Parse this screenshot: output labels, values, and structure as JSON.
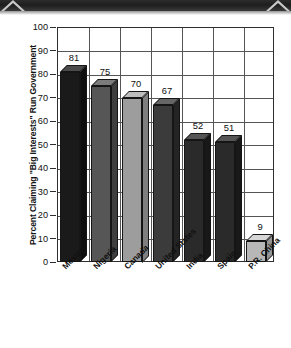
{
  "decor": {
    "band_name": "scanned-page-edge-band",
    "band_color": "#242424",
    "chevron_color": "#c9c9c9"
  },
  "chart_data": {
    "type": "bar",
    "title": "",
    "subtitle": "",
    "xlabel": "",
    "ylabel": "Percent Claiming \"Big Interests\" Run Government",
    "categories": [
      "Mexico",
      "Nigeria",
      "Canada",
      "United States",
      "India",
      "Spain",
      "P.R. China"
    ],
    "values": [
      81,
      75,
      70,
      67,
      52,
      51,
      9
    ],
    "value_labels": [
      "81",
      "75",
      "70",
      "67",
      "52",
      "51",
      "9"
    ],
    "ylim": [
      0,
      100
    ],
    "ytick_values": [
      100,
      90,
      80,
      70,
      60,
      50,
      40,
      30,
      20,
      10,
      0
    ],
    "ytick_labels": [
      "100",
      "90",
      "80",
      "70",
      "60",
      "50",
      "40",
      "30",
      "20",
      "10",
      "0"
    ],
    "grid": "horizontal-and-vertical",
    "legend": "none",
    "style": "3d-isometric-bars",
    "bar_colors": [
      "#1a1a1a",
      "#565656",
      "#9d9d9d",
      "#3b3b3b",
      "#2a2a2a",
      "#2a2a2a",
      "#b7b7b7"
    ],
    "bar_top_colors": [
      "#4a4a4a",
      "#7c7c7c",
      "#bdbdbd",
      "#666666",
      "#555555",
      "#555555",
      "#d6d6d6"
    ],
    "bar_side_colors": [
      "#0e0e0e",
      "#3f3f3f",
      "#7f7f7f",
      "#242424",
      "#181818",
      "#181818",
      "#949494"
    ]
  }
}
